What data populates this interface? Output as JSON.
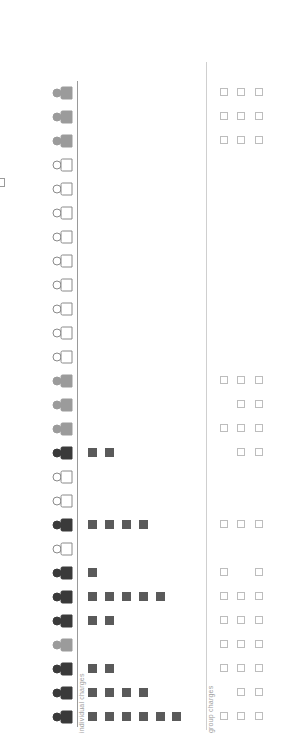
{
  "chart_data": {
    "type": "pictogram",
    "orientation": "rotated-90",
    "title": "",
    "sections": [
      {
        "name": "individual charges",
        "label": "individual charges"
      },
      {
        "name": "group charges",
        "label": "group charges"
      }
    ],
    "categories_legend": {
      "dark": "#3a3a3a",
      "light": "#9b9b9b",
      "outline": "none"
    },
    "rows": [
      {
        "index": 1,
        "person": "light",
        "individual_charges": 0,
        "group_charges": [
          1,
          1,
          1
        ]
      },
      {
        "index": 2,
        "person": "light",
        "individual_charges": 0,
        "group_charges": [
          1,
          1,
          1
        ]
      },
      {
        "index": 3,
        "person": "light",
        "individual_charges": 0,
        "group_charges": [
          1,
          1,
          1
        ]
      },
      {
        "index": 4,
        "person": "outline",
        "individual_charges": 0,
        "group_charges": [
          0,
          0,
          0
        ]
      },
      {
        "index": 5,
        "person": "outline",
        "individual_charges": 0,
        "group_charges": [
          0,
          0,
          0
        ]
      },
      {
        "index": 6,
        "person": "outline",
        "individual_charges": 0,
        "group_charges": [
          0,
          0,
          0
        ]
      },
      {
        "index": 7,
        "person": "outline",
        "individual_charges": 0,
        "group_charges": [
          0,
          0,
          0
        ]
      },
      {
        "index": 8,
        "person": "outline",
        "individual_charges": 0,
        "group_charges": [
          0,
          0,
          0
        ]
      },
      {
        "index": 9,
        "person": "outline",
        "individual_charges": 0,
        "group_charges": [
          0,
          0,
          0
        ]
      },
      {
        "index": 10,
        "person": "outline",
        "individual_charges": 0,
        "group_charges": [
          0,
          0,
          0
        ]
      },
      {
        "index": 11,
        "person": "outline",
        "individual_charges": 0,
        "group_charges": [
          0,
          0,
          0
        ]
      },
      {
        "index": 12,
        "person": "outline",
        "individual_charges": 0,
        "group_charges": [
          0,
          0,
          0
        ]
      },
      {
        "index": 13,
        "person": "light",
        "individual_charges": 0,
        "group_charges": [
          1,
          1,
          1
        ]
      },
      {
        "index": 14,
        "person": "light",
        "individual_charges": 0,
        "group_charges": [
          0,
          1,
          1
        ]
      },
      {
        "index": 15,
        "person": "light",
        "individual_charges": 0,
        "group_charges": [
          1,
          1,
          1
        ]
      },
      {
        "index": 16,
        "person": "dark",
        "individual_charges": 2,
        "group_charges": [
          0,
          1,
          1
        ]
      },
      {
        "index": 17,
        "person": "outline",
        "individual_charges": 0,
        "group_charges": [
          0,
          0,
          0
        ]
      },
      {
        "index": 18,
        "person": "outline",
        "individual_charges": 0,
        "group_charges": [
          0,
          0,
          0
        ]
      },
      {
        "index": 19,
        "person": "dark",
        "individual_charges": 4,
        "group_charges": [
          1,
          1,
          1
        ]
      },
      {
        "index": 20,
        "person": "outline",
        "individual_charges": 0,
        "group_charges": [
          0,
          0,
          0
        ]
      },
      {
        "index": 21,
        "person": "dark",
        "individual_charges": 1,
        "group_charges": [
          1,
          0,
          1
        ]
      },
      {
        "index": 22,
        "person": "dark",
        "individual_charges": 5,
        "group_charges": [
          1,
          1,
          1
        ]
      },
      {
        "index": 23,
        "person": "dark",
        "individual_charges": 2,
        "group_charges": [
          1,
          1,
          1
        ]
      },
      {
        "index": 24,
        "person": "light",
        "individual_charges": 0,
        "group_charges": [
          1,
          1,
          1
        ]
      },
      {
        "index": 25,
        "person": "dark",
        "individual_charges": 2,
        "group_charges": [
          1,
          1,
          1
        ]
      },
      {
        "index": 26,
        "person": "dark",
        "individual_charges": 4,
        "group_charges": [
          0,
          1,
          1
        ]
      },
      {
        "index": 27,
        "person": "dark",
        "individual_charges": 6,
        "group_charges": [
          1,
          1,
          1
        ]
      }
    ],
    "totals": {
      "people": 27,
      "dark_people": 9,
      "light_people": 7,
      "outline_people": 11,
      "individual_charges": 26
    },
    "grid": false,
    "legend_position": "left (clipped)"
  },
  "labels": {
    "individual_charges": "individual charges",
    "group_charges": "group charges"
  },
  "colors": {
    "dark_person": "#3a3a3a",
    "light_person": "#9b9b9b",
    "outline_person": "#8a8a8a",
    "individual_square": "#5a5a5a",
    "group_square_border": "#bdbdbd",
    "axis": "#9a9a9a",
    "separator": "#cfcfcf",
    "label_text": "#a0a0a0"
  },
  "layout": {
    "row_top_start": 81,
    "row_pitch": 24,
    "individual_x": [
      88,
      105,
      122,
      139,
      156,
      172
    ],
    "group_x": [
      220,
      237,
      255
    ]
  }
}
